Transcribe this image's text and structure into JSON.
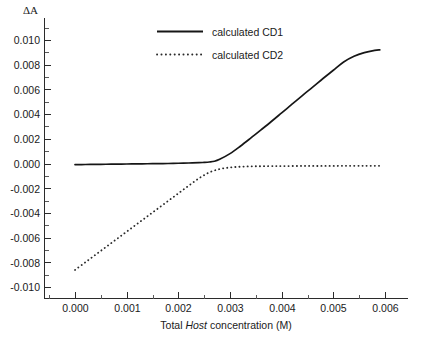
{
  "chart_data": {
    "type": "line",
    "title": "",
    "xlabel_parts": {
      "prefix": "Total ",
      "italic": "Host",
      "suffix": " concentration (M)"
    },
    "xlabel": "Total Host concentration (M)",
    "ylabel": "ΔA",
    "xlim": [
      -0.00042,
      0.00652
    ],
    "ylim": [
      -0.0112,
      0.0112
    ],
    "xticks": [
      0.0,
      0.001,
      0.002,
      0.003,
      0.004,
      0.005,
      0.006
    ],
    "xtick_labels": [
      "0.000",
      "0.001",
      "0.002",
      "0.003",
      "0.004",
      "0.005",
      "0.006"
    ],
    "yticks": [
      -0.01,
      -0.008,
      -0.006,
      -0.004,
      -0.002,
      0.0,
      0.002,
      0.004,
      0.006,
      0.008,
      0.01
    ],
    "ytick_labels": [
      "-0.010",
      "-0.008",
      "-0.006",
      "-0.004",
      "-0.002",
      "0.000",
      "0.002",
      "0.004",
      "0.006",
      "0.008",
      "0.010"
    ],
    "minor_ticks_per_interval": 1,
    "grid": false,
    "legend_position": "top-center",
    "series": [
      {
        "name": "calculated CD1",
        "style": "solid",
        "color": "#161616",
        "x": [
          0.0,
          0.0002,
          0.0004,
          0.0006,
          0.0008,
          0.001,
          0.0012,
          0.0014,
          0.0016,
          0.0018,
          0.002,
          0.0022,
          0.0024,
          0.0025,
          0.0026,
          0.0027,
          0.0028,
          0.003,
          0.0032,
          0.0034,
          0.0036,
          0.0038,
          0.004,
          0.0042,
          0.0044,
          0.0046,
          0.0048,
          0.005,
          0.0052,
          0.0054,
          0.0056,
          0.0058,
          0.0059
        ],
        "y": [
          -9e-05,
          -8e-05,
          -7e-05,
          -6e-05,
          -5e-05,
          -4e-05,
          -3e-05,
          -2e-05,
          -1e-05,
          0.0,
          2e-05,
          4e-05,
          7e-05,
          9e-05,
          0.00012,
          0.00018,
          0.00034,
          0.0008,
          0.0014,
          0.00205,
          0.00272,
          0.0034,
          0.0041,
          0.0048,
          0.0055,
          0.00618,
          0.00688,
          0.00755,
          0.00822,
          0.00868,
          0.00898,
          0.00916,
          0.0092
        ]
      },
      {
        "name": "calculated CD2",
        "style": "dotted",
        "color": "#2a2a2a",
        "x": [
          0.0,
          0.0002,
          0.0004,
          0.0006,
          0.0008,
          0.001,
          0.0012,
          0.0014,
          0.0016,
          0.0018,
          0.002,
          0.0022,
          0.0024,
          0.0026,
          0.0028,
          0.003,
          0.0032,
          0.0034,
          0.0036,
          0.0038,
          0.004,
          0.0044,
          0.0048,
          0.0052,
          0.0056,
          0.0059
        ],
        "y": [
          -0.00862,
          -0.008,
          -0.00738,
          -0.00676,
          -0.00614,
          -0.00552,
          -0.0049,
          -0.00428,
          -0.00366,
          -0.00304,
          -0.00242,
          -0.0018,
          -0.0012,
          -0.00072,
          -0.00045,
          -0.00032,
          -0.00026,
          -0.00023,
          -0.00022,
          -0.00021,
          -0.00021,
          -0.0002,
          -0.0002,
          -0.00019,
          -0.00019,
          -0.00019
        ]
      }
    ]
  },
  "legend": {
    "entries": [
      {
        "label": "calculated CD1"
      },
      {
        "label": "calculated CD2"
      }
    ]
  }
}
